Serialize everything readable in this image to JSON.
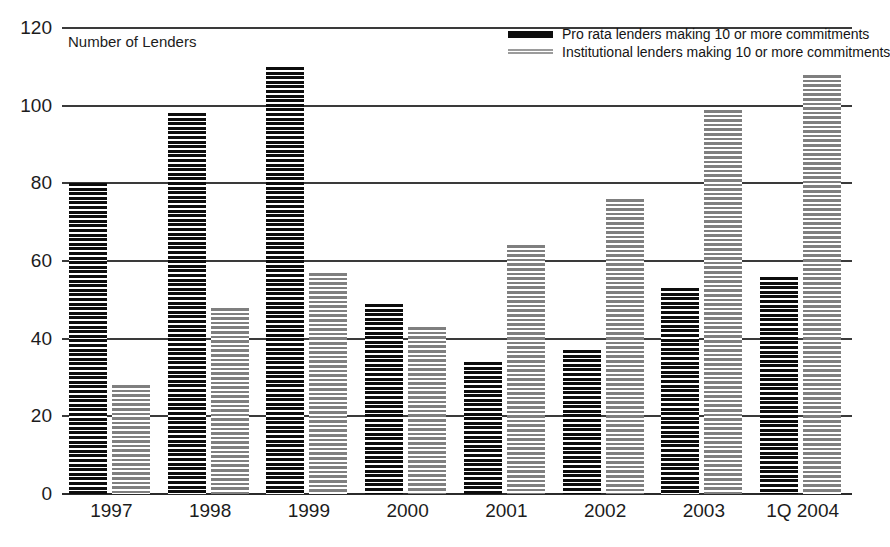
{
  "chart_data": {
    "type": "bar",
    "title": "",
    "subtitle": "",
    "xlabel": "",
    "ylabel": "Number of Lenders",
    "ylim": [
      0,
      120
    ],
    "ytick_step": 20,
    "yticks": [
      120,
      100,
      80,
      60,
      40,
      20,
      0
    ],
    "grid": true,
    "legend_position": "top-right",
    "categories": [
      "1997",
      "1998",
      "1999",
      "2000",
      "2001",
      "2002",
      "2003",
      "1Q 2004"
    ],
    "series": [
      {
        "name": "Pro rata lenders making 10 or more commitments",
        "style": "black-horizontal-stripes",
        "color": "#0d0d0d",
        "values": [
          80,
          98,
          110,
          49,
          34,
          37,
          53,
          56
        ]
      },
      {
        "name": "Institutional lenders making 10 or more commitments",
        "style": "gray-stippled-stripes",
        "color": "#9a9a9a",
        "values": [
          28,
          48,
          57,
          43,
          64,
          76,
          99,
          108
        ]
      }
    ],
    "annotations": []
  },
  "axis_title": "Number of Lenders",
  "legend": {
    "items": [
      {
        "label": "Pro rata lenders making 10 or more commitments",
        "swatch": "dark-bar-swatch"
      },
      {
        "label": "Institutional lenders making 10 or more commitments",
        "swatch": "light-bar-swatch"
      }
    ]
  }
}
